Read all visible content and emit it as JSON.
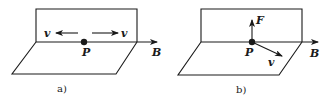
{
  "panels": [
    {
      "id": "a",
      "caption": "a)",
      "point_label": "P",
      "field_label": "B",
      "velocity_left_label": "v",
      "velocity_right_label": "v"
    },
    {
      "id": "b",
      "caption": "b)",
      "point_label": "P",
      "field_label": "B",
      "force_label": "F",
      "velocity_label": "v"
    }
  ],
  "colors": {
    "stroke": "#1a1a1a",
    "background": "#ffffff"
  }
}
